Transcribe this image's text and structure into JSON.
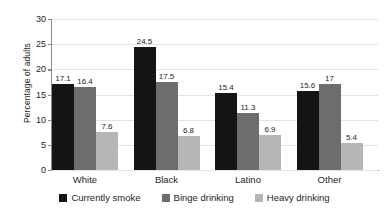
{
  "chart_data": {
    "type": "bar",
    "title": "",
    "xlabel": "",
    "ylabel": "Percentage of adults",
    "ylim": [
      0,
      30
    ],
    "yticks": [
      "0",
      "5",
      "10",
      "15",
      "20",
      "25",
      "30"
    ],
    "grid": true,
    "legend_position": "bottom",
    "categories": [
      "White",
      "Black",
      "Latino",
      "Other"
    ],
    "series": [
      {
        "name": "Currently smoke",
        "color": "#151515",
        "values": [
          17.1,
          24.5,
          15.4,
          15.6
        ],
        "labels": [
          "17.1",
          "24.5",
          "15.4",
          "15.6"
        ]
      },
      {
        "name": "Binge drinking",
        "color": "#6d6d6d",
        "values": [
          16.4,
          17.5,
          11.3,
          17
        ],
        "labels": [
          "16.4",
          "17.5",
          "11.3",
          "17"
        ]
      },
      {
        "name": "Heavy drinking",
        "color": "#b6b6b6",
        "values": [
          7.6,
          6.8,
          6.9,
          5.4
        ],
        "labels": [
          "7.6",
          "6.8",
          "6.9",
          "5.4"
        ]
      }
    ]
  }
}
